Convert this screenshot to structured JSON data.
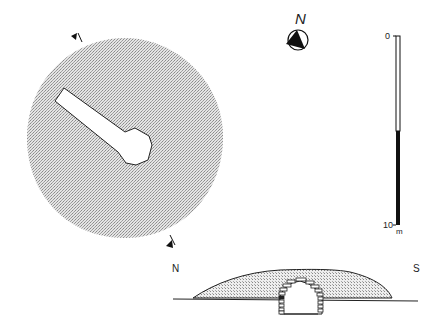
{
  "plan": {
    "north_label": "N",
    "section_marker_top": "section-line-marker",
    "section_marker_bottom": "section-line-marker"
  },
  "scale_bar": {
    "top_label": "0",
    "bottom_label": "10",
    "unit": "m"
  },
  "section": {
    "left_label": "N",
    "right_label": "S"
  },
  "colors": {
    "mound_fill": "#c8c8c8",
    "line": "#222222",
    "background": "#ffffff"
  }
}
